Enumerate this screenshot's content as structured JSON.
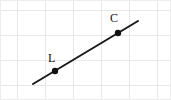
{
  "figure": {
    "type": "geometry-diagram",
    "width": 171,
    "height": 100,
    "background_color": "#ffffff",
    "border_color": "#ededed"
  },
  "grid": {
    "visible": true,
    "color": "#e8e8e8",
    "line_width": 1,
    "cell_width": 28,
    "cell_height": 25,
    "vertical_lines": [
      17,
      45,
      73,
      101,
      129,
      157
    ],
    "horizontal_lines": [
      10,
      35,
      60,
      85
    ]
  },
  "line": {
    "color": "#1a1a1a",
    "width": 2,
    "start_x": 33,
    "start_y": 84,
    "end_x": 138,
    "end_y": 21
  },
  "points": [
    {
      "id": "point-l",
      "label": "L",
      "x": 55,
      "y": 71,
      "radius": 3.2,
      "color": "#111111",
      "label_x": 48,
      "label_y": 52
    },
    {
      "id": "point-c",
      "label": "C",
      "x": 118,
      "y": 33,
      "radius": 3.2,
      "color": "#111111",
      "label_x": 110,
      "label_y": 12
    }
  ],
  "chart_data": {
    "type": "scatter",
    "xlabel": "",
    "ylabel": "",
    "grid": true,
    "legend": "none",
    "series": [
      {
        "name": "segment",
        "kind": "line",
        "x": [
          33,
          138
        ],
        "y": [
          84,
          21
        ]
      },
      {
        "name": "points",
        "kind": "scatter",
        "x": [
          55,
          118
        ],
        "y": [
          71,
          33
        ],
        "labels": [
          "L",
          "C"
        ]
      }
    ]
  }
}
